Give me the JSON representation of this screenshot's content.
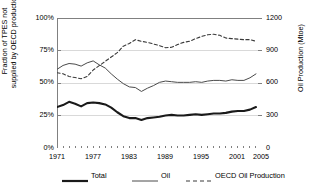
{
  "chart_data": {
    "type": "line",
    "title": "",
    "xlabel": "",
    "ylabel": "Fraction of TPES not supplied by OECD production",
    "ylabel_line1": "Fraction of TPES not",
    "ylabel_line2": "supplied by OECD production",
    "y2label": "Oil Production (Mtoe)",
    "grid": true,
    "legend_position": "bottom",
    "xlim": [
      1971,
      2005
    ],
    "ylim": [
      0,
      100
    ],
    "y2lim": [
      0,
      1200
    ],
    "xticks": [
      1971,
      1977,
      1983,
      1989,
      1995,
      2001,
      2005
    ],
    "xtick_labels": [
      "1971",
      "1977",
      "1983",
      "1989",
      "1995",
      "2001",
      "2005"
    ],
    "yticks": [
      0,
      25,
      50,
      75,
      100
    ],
    "ytick_labels": [
      "0%",
      "25%",
      "50%",
      "75%",
      "100%"
    ],
    "y2ticks": [
      0,
      300,
      600,
      900,
      1200
    ],
    "y2tick_labels": [
      "0",
      "300",
      "600",
      "900",
      "1200"
    ],
    "x": [
      1971,
      1972,
      1973,
      1974,
      1975,
      1976,
      1977,
      1978,
      1979,
      1980,
      1981,
      1982,
      1983,
      1984,
      1985,
      1986,
      1987,
      1988,
      1989,
      1990,
      1991,
      1992,
      1993,
      1994,
      1995,
      1996,
      1997,
      1998,
      1999,
      2000,
      2001,
      2002,
      2003,
      2004
    ],
    "series": [
      {
        "name": "Total",
        "style": "solid-thick",
        "axis": "left",
        "unit": "%",
        "color": "#1a1a1a",
        "values": [
          31.5,
          33.0,
          35.5,
          34.0,
          32.0,
          34.5,
          35.0,
          34.5,
          33.5,
          31.0,
          27.5,
          24.5,
          23.0,
          23.0,
          21.5,
          23.0,
          23.5,
          24.0,
          25.0,
          25.5,
          25.0,
          25.0,
          25.5,
          26.0,
          25.5,
          26.0,
          26.5,
          26.5,
          27.0,
          28.0,
          28.5,
          28.5,
          29.5,
          31.5
        ]
      },
      {
        "name": "Oil",
        "style": "solid-thin",
        "axis": "left",
        "unit": "%",
        "color": "#4a4a4a",
        "values": [
          60.5,
          63.5,
          65.0,
          64.5,
          63.0,
          65.5,
          67.0,
          64.0,
          61.5,
          57.0,
          53.0,
          49.5,
          47.0,
          46.5,
          43.5,
          46.0,
          48.0,
          50.5,
          51.5,
          51.0,
          50.5,
          50.5,
          50.5,
          51.0,
          50.5,
          51.5,
          52.0,
          52.0,
          51.5,
          52.5,
          52.0,
          52.0,
          54.0,
          57.0
        ]
      },
      {
        "name": "OECD Oil Production",
        "style": "dashed",
        "axis": "right",
        "unit": "Mtoe",
        "color": "#3a3a3a",
        "values": [
          695,
          685,
          660,
          650,
          640,
          660,
          720,
          760,
          800,
          840,
          880,
          940,
          965,
          1000,
          985,
          975,
          960,
          945,
          925,
          930,
          955,
          975,
          985,
          1010,
          1030,
          1045,
          1050,
          1040,
          1015,
          1010,
          1005,
          1000,
          1000,
          985
        ]
      }
    ],
    "legend": [
      {
        "label": "Total",
        "style": "solid-thick"
      },
      {
        "label": "Oil",
        "style": "solid-thin"
      },
      {
        "label": "OECD Oil Production",
        "style": "dashed"
      }
    ]
  },
  "colors": {
    "background": "#ffffff",
    "axis": "#808080",
    "grid": "#d9d9d9",
    "text": "#000000"
  }
}
